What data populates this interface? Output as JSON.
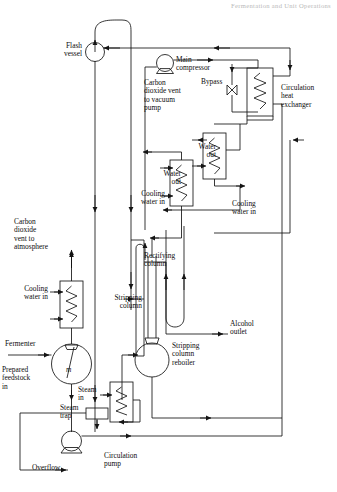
{
  "page": {
    "header_note": "Fermentation and Unit Operations"
  },
  "labels": {
    "flash_vessel": "Flash\nvessel",
    "main_compressor": "Main\ncompressor",
    "co2_vent_vacuum": "Carbon\ndioxide vent\nto vacuum\npump",
    "bypass": "Bypass",
    "circulation_heat_exchanger": "Circulation\nheat\nexchanger",
    "water_out_upper": "Water\nout",
    "water_out_lower": "Water\nout",
    "cooling_water_in_right": "Cooling\nwater in",
    "cooling_water_in_mid": "Cooling\nwater in",
    "cooling_water_in_left": "Cooling\nwater in",
    "co2_vent_atmosphere": "Carbon\ndioxide\nvent to\natmosphere",
    "rectifying_column": "Rectifying\ncolumn",
    "stripping_column": "Stripping\ncolumn",
    "stripping_column_reboiler": "Stripping\ncolumn\nreboiler",
    "alcohol_outlet": "Alcohol\noutlet",
    "fermenter": "Fermenter",
    "fermenter_mixer": "m",
    "prepared_feedstock": "Prepared\nfeedstock\nin",
    "steam_in": "Steam\nin",
    "steam_trap": "Steam\ntrap",
    "circulation_pump": "Circulation\npump",
    "overflow": "Overflow"
  },
  "equipment": [
    {
      "name": "flash-vessel",
      "type": "vessel-circle",
      "label": "Flash vessel"
    },
    {
      "name": "main-compressor",
      "type": "compressor",
      "label": "Main compressor"
    },
    {
      "name": "bypass-valve",
      "type": "globe-valve",
      "label": "Bypass"
    },
    {
      "name": "circulation-heat-exchanger",
      "type": "heat-exchanger",
      "label": "Circulation heat exchanger"
    },
    {
      "name": "condenser-upper",
      "type": "heat-exchanger",
      "label": "Water out"
    },
    {
      "name": "condenser-lower",
      "type": "heat-exchanger",
      "label": "Water out"
    },
    {
      "name": "fermenter-cooler",
      "type": "heat-exchanger",
      "label": "Cooling water in"
    },
    {
      "name": "rectifying-column",
      "type": "column",
      "label": "Rectifying column"
    },
    {
      "name": "stripping-column",
      "type": "column",
      "label": "Stripping column"
    },
    {
      "name": "stripping-column-reboiler",
      "type": "vessel-sphere",
      "label": "Stripping column reboiler"
    },
    {
      "name": "fermenter",
      "type": "vessel-sphere-agitated",
      "label": "Fermenter"
    },
    {
      "name": "steam-heater",
      "type": "heat-exchanger",
      "label": "Steam in"
    },
    {
      "name": "steam-trap",
      "type": "trap",
      "label": "Steam trap"
    },
    {
      "name": "circulation-pump",
      "type": "pump",
      "label": "Circulation pump"
    }
  ],
  "streams": [
    {
      "name": "co2-vent-to-atmosphere",
      "label": "Carbon dioxide vent to atmosphere"
    },
    {
      "name": "co2-vent-to-vacuum-pump",
      "label": "Carbon dioxide vent to vacuum pump"
    },
    {
      "name": "prepared-feedstock-in",
      "label": "Prepared feedstock in"
    },
    {
      "name": "alcohol-outlet",
      "label": "Alcohol outlet"
    },
    {
      "name": "overflow",
      "label": "Overflow"
    },
    {
      "name": "steam-in",
      "label": "Steam in"
    },
    {
      "name": "cooling-water-in",
      "label": "Cooling water in"
    },
    {
      "name": "water-out",
      "label": "Water out"
    },
    {
      "name": "bypass",
      "label": "Bypass"
    }
  ],
  "colors": {
    "line": "#141414",
    "paper": "#ffffff",
    "text": "#0d0d0d",
    "header": "#b9b9b9"
  }
}
